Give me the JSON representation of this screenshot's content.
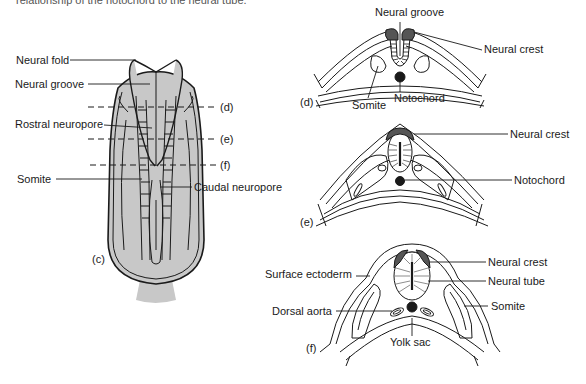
{
  "caption": "relationship of the notochord to the neural tube.",
  "panel_c": {
    "label": "(c)",
    "labels": {
      "neural_fold": "Neural fold",
      "neural_groove": "Neural groove",
      "rostral_neuropore": "Rostral neuropore",
      "somite": "Somite",
      "caudal_neuropore": "Caudal neuropore"
    },
    "section_markers": [
      "(d)",
      "(e)",
      "(f)"
    ]
  },
  "panel_d": {
    "label": "(d)",
    "labels": {
      "neural_groove": "Neural groove",
      "neural_crest": "Neural crest",
      "somite": "Somite",
      "notochord": "Notochord"
    }
  },
  "panel_e": {
    "label": "(e)",
    "labels": {
      "neural_crest": "Neural crest",
      "notochord": "Notochord"
    }
  },
  "panel_f": {
    "label": "(f)",
    "labels": {
      "surface_ectoderm": "Surface ectoderm",
      "neural_crest": "Neural crest",
      "neural_tube": "Neural tube",
      "dorsal_aorta": "Dorsal aorta",
      "somite": "Somite",
      "yolk_sac": "Yolk sac"
    }
  },
  "colors": {
    "tissue_fill": "#c8c8c8",
    "dark_fill": "#555555",
    "line": "#1a1a1a"
  }
}
